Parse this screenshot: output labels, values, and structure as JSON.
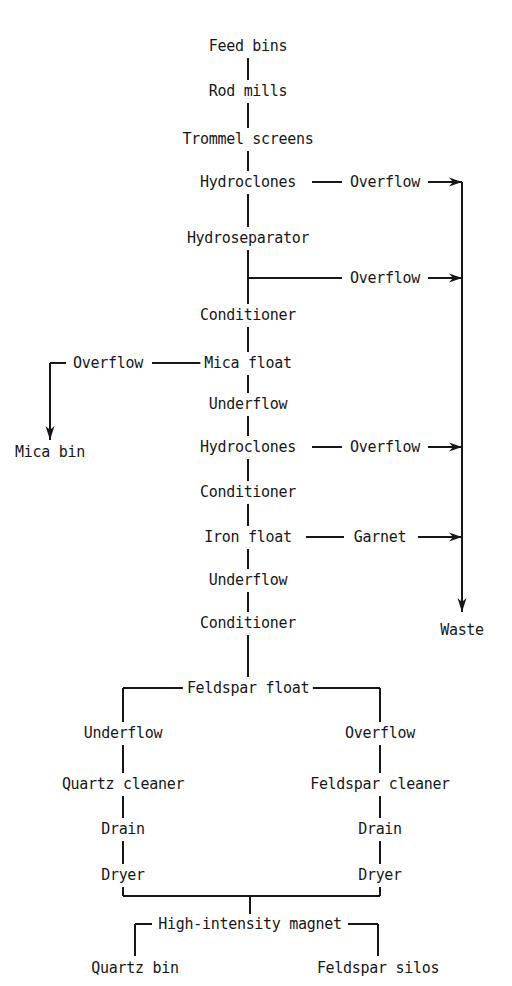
{
  "diagram": {
    "type": "process-flow-diagram",
    "colors": {
      "background": "#ffffff",
      "stroke": "#17171a",
      "text": "#17171a"
    },
    "nodes": [
      {
        "id": "feed-bins",
        "label": "Feed bins",
        "x": 248,
        "y": 46
      },
      {
        "id": "rod-mills",
        "label": "Rod mills",
        "x": 248,
        "y": 91
      },
      {
        "id": "trommel-screens",
        "label": "Trommel screens",
        "x": 248,
        "y": 139
      },
      {
        "id": "hydroclones-1",
        "label": "Hydroclones",
        "x": 248,
        "y": 182
      },
      {
        "id": "overflow-1",
        "label": "Overflow",
        "x": 385,
        "y": 182
      },
      {
        "id": "hydroseparator",
        "label": "Hydroseparator",
        "x": 248,
        "y": 238
      },
      {
        "id": "overflow-2",
        "label": "Overflow",
        "x": 385,
        "y": 278
      },
      {
        "id": "conditioner-1",
        "label": "Conditioner",
        "x": 248,
        "y": 315
      },
      {
        "id": "overflow-3",
        "label": "Overflow",
        "x": 108,
        "y": 363
      },
      {
        "id": "mica-float",
        "label": "Mica float",
        "x": 248,
        "y": 363
      },
      {
        "id": "mica-bin",
        "label": "Mica bin",
        "x": 50,
        "y": 452
      },
      {
        "id": "underflow-1",
        "label": "Underflow",
        "x": 248,
        "y": 404
      },
      {
        "id": "hydroclones-2",
        "label": "Hydroclones",
        "x": 248,
        "y": 447
      },
      {
        "id": "overflow-4",
        "label": "Overflow",
        "x": 385,
        "y": 447
      },
      {
        "id": "conditioner-2",
        "label": "Conditioner",
        "x": 248,
        "y": 492
      },
      {
        "id": "iron-float",
        "label": "Iron float",
        "x": 248,
        "y": 537
      },
      {
        "id": "garnet",
        "label": "Garnet",
        "x": 380,
        "y": 537
      },
      {
        "id": "underflow-2",
        "label": "Underflow",
        "x": 248,
        "y": 580
      },
      {
        "id": "waste",
        "label": "Waste",
        "x": 462,
        "y": 630
      },
      {
        "id": "conditioner-3",
        "label": "Conditioner",
        "x": 248,
        "y": 623
      },
      {
        "id": "feldspar-float",
        "label": "Feldspar float",
        "x": 248,
        "y": 688
      },
      {
        "id": "underflow-3",
        "label": "Underflow",
        "x": 123,
        "y": 733
      },
      {
        "id": "overflow-5",
        "label": "Overflow",
        "x": 380,
        "y": 733
      },
      {
        "id": "quartz-cleaner",
        "label": "Quartz cleaner",
        "x": 123,
        "y": 784
      },
      {
        "id": "feldspar-cleaner",
        "label": "Feldspar cleaner",
        "x": 380,
        "y": 784
      },
      {
        "id": "drain-left",
        "label": "Drain",
        "x": 123,
        "y": 829
      },
      {
        "id": "drain-right",
        "label": "Drain",
        "x": 380,
        "y": 829
      },
      {
        "id": "dryer-left",
        "label": "Dryer",
        "x": 123,
        "y": 875
      },
      {
        "id": "dryer-right",
        "label": "Dryer",
        "x": 380,
        "y": 875
      },
      {
        "id": "high-intensity-magnet",
        "label": "High-intensity magnet",
        "x": 250,
        "y": 924
      },
      {
        "id": "quartz-bin",
        "label": "Quartz bin",
        "x": 135,
        "y": 968
      },
      {
        "id": "feldspar-silos",
        "label": "Feldspar silos",
        "x": 378,
        "y": 968
      }
    ],
    "connectors": [
      {
        "id": "feed-to-rod",
        "kind": "vertical",
        "x": 248,
        "y1": 58,
        "y2": 80
      },
      {
        "id": "rod-to-trommel",
        "kind": "vertical",
        "x": 248,
        "y1": 103,
        "y2": 128
      },
      {
        "id": "trommel-to-hydroclones",
        "kind": "vertical",
        "x": 248,
        "y1": 151,
        "y2": 171
      },
      {
        "id": "hydroclones1-to-overflow1",
        "kind": "horizontal",
        "y": 182,
        "x1": 312,
        "x2": 342
      },
      {
        "id": "overflow1-to-waste",
        "kind": "arrow",
        "y": 182,
        "x1": 428,
        "x2": 462
      },
      {
        "id": "hydroclones1-to-hydrosep",
        "kind": "vertical",
        "x": 248,
        "y1": 194,
        "y2": 227
      },
      {
        "id": "hydrosep-to-conditioner1",
        "kind": "vertical",
        "x": 248,
        "y1": 250,
        "y2": 304
      },
      {
        "id": "stem-to-overflow2",
        "kind": "horizontal",
        "y": 278,
        "x1": 248,
        "x2": 342
      },
      {
        "id": "overflow2-to-waste",
        "kind": "arrow",
        "y": 278,
        "x1": 428,
        "x2": 462
      },
      {
        "id": "conditioner1-to-micafloat",
        "kind": "vertical",
        "x": 248,
        "y1": 327,
        "y2": 352
      },
      {
        "id": "micafloat-to-overflow3",
        "kind": "horizontal",
        "y": 363,
        "x1": 152,
        "x2": 202
      },
      {
        "id": "overflow3-elbow-h",
        "kind": "horizontal",
        "y": 363,
        "x1": 50,
        "x2": 66
      },
      {
        "id": "overflow3-elbow-v",
        "kind": "arrow-down",
        "x": 50,
        "y1": 363,
        "y2": 440
      },
      {
        "id": "micafloat-to-underflow1",
        "kind": "vertical",
        "x": 248,
        "y1": 375,
        "y2": 393
      },
      {
        "id": "underflow1-to-hydroclones2",
        "kind": "vertical",
        "x": 248,
        "y1": 416,
        "y2": 436
      },
      {
        "id": "hydroclones2-to-overflow4",
        "kind": "horizontal",
        "y": 447,
        "x1": 312,
        "x2": 342
      },
      {
        "id": "overflow4-to-waste",
        "kind": "arrow",
        "y": 447,
        "x1": 428,
        "x2": 462
      },
      {
        "id": "hydroclones2-to-cond2",
        "kind": "vertical",
        "x": 248,
        "y1": 459,
        "y2": 481
      },
      {
        "id": "cond2-to-ironfloat",
        "kind": "vertical",
        "x": 248,
        "y1": 504,
        "y2": 526
      },
      {
        "id": "ironfloat-to-garnet",
        "kind": "horizontal",
        "y": 537,
        "x1": 306,
        "x2": 344
      },
      {
        "id": "garnet-to-waste",
        "kind": "arrow",
        "y": 537,
        "x1": 418,
        "x2": 462
      },
      {
        "id": "ironfloat-to-underflow2",
        "kind": "vertical",
        "x": 248,
        "y1": 549,
        "y2": 569
      },
      {
        "id": "underflow2-to-cond3",
        "kind": "vertical",
        "x": 248,
        "y1": 592,
        "y2": 612
      },
      {
        "id": "waste-line",
        "kind": "arrow-down",
        "x": 462,
        "y1": 182,
        "y2": 612
      },
      {
        "id": "cond3-to-feldsparfloat",
        "kind": "vertical",
        "x": 248,
        "y1": 635,
        "y2": 677
      },
      {
        "id": "feldsparfloat-left-h",
        "kind": "horizontal",
        "y": 688,
        "x1": 123,
        "x2": 185
      },
      {
        "id": "feldsparfloat-right-h",
        "kind": "horizontal",
        "y": 688,
        "x1": 312,
        "x2": 380
      },
      {
        "id": "feldsparfloat-left-v",
        "kind": "vertical",
        "x": 123,
        "y1": 688,
        "y2": 722
      },
      {
        "id": "feldsparfloat-right-v",
        "kind": "vertical",
        "x": 380,
        "y1": 688,
        "y2": 722
      },
      {
        "id": "underflow3-to-quartz",
        "kind": "vertical",
        "x": 123,
        "y1": 745,
        "y2": 773
      },
      {
        "id": "overflow5-to-feldspar",
        "kind": "vertical",
        "x": 380,
        "y1": 745,
        "y2": 773
      },
      {
        "id": "quartz-to-drain",
        "kind": "vertical",
        "x": 123,
        "y1": 796,
        "y2": 818
      },
      {
        "id": "feldsparcl-to-drain",
        "kind": "vertical",
        "x": 380,
        "y1": 796,
        "y2": 818
      },
      {
        "id": "drainl-to-dryerl",
        "kind": "vertical",
        "x": 123,
        "y1": 841,
        "y2": 864
      },
      {
        "id": "drainr-to-dryerr",
        "kind": "vertical",
        "x": 380,
        "y1": 841,
        "y2": 864
      },
      {
        "id": "dryerl-down",
        "kind": "vertical",
        "x": 123,
        "y1": 887,
        "y2": 896
      },
      {
        "id": "dryerr-down",
        "kind": "vertical",
        "x": 380,
        "y1": 887,
        "y2": 896
      },
      {
        "id": "dryers-merge-h",
        "kind": "horizontal",
        "y": 896,
        "x1": 123,
        "x2": 380
      },
      {
        "id": "merge-to-magnet",
        "kind": "vertical",
        "x": 250,
        "y1": 896,
        "y2": 914
      },
      {
        "id": "magnet-left-h",
        "kind": "horizontal",
        "y": 924,
        "x1": 135,
        "x2": 152
      },
      {
        "id": "magnet-right-h",
        "kind": "horizontal",
        "y": 924,
        "x1": 348,
        "x2": 378
      },
      {
        "id": "magnet-left-v",
        "kind": "vertical",
        "x": 135,
        "y1": 924,
        "y2": 956
      },
      {
        "id": "magnet-right-v",
        "kind": "vertical",
        "x": 378,
        "y1": 924,
        "y2": 956
      }
    ]
  }
}
